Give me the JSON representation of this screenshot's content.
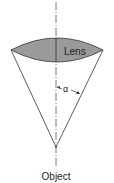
{
  "diagram": {
    "labels": {
      "lens": "Lens",
      "angle": "α",
      "object": "Object"
    },
    "colors": {
      "lens_fill": "#9a9a9a",
      "stroke": "#333333",
      "background": "#ffffff"
    }
  }
}
